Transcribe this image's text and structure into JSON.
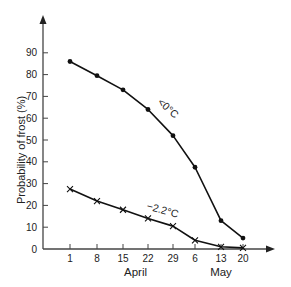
{
  "chart_data": {
    "type": "line",
    "title": "",
    "xlabel": "",
    "ylabel": "Probability of frost (%)",
    "ylim": [
      0,
      90
    ],
    "yticks": [
      0,
      10,
      20,
      30,
      40,
      50,
      60,
      70,
      80,
      90
    ],
    "categories": [
      "1",
      "8",
      "15",
      "22",
      "29",
      "6",
      "13",
      "20"
    ],
    "month_labels": [
      {
        "label": "April",
        "center_index": 2.5
      },
      {
        "label": "May",
        "center_index": 6
      }
    ],
    "grid": false,
    "legend": "inline labels",
    "series": [
      {
        "name": "<0°C",
        "marker": "dot",
        "values": [
          86,
          79.5,
          73,
          64,
          52,
          37.5,
          13,
          5
        ]
      },
      {
        "name": "−2.2°C",
        "marker": "x",
        "values": [
          27.5,
          22,
          18,
          14,
          10.5,
          4,
          1,
          0.5
        ]
      }
    ]
  }
}
